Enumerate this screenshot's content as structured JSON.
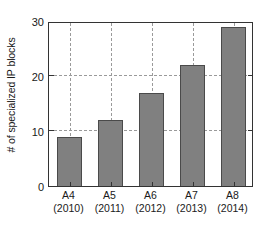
{
  "chart_data": {
    "type": "bar",
    "title": "",
    "xlabel": "",
    "ylabel": "# of specialized IP blocks",
    "categories": [
      "A4",
      "A5",
      "A6",
      "A7",
      "A8"
    ],
    "category_sublabels": [
      "(2010)",
      "(2011)",
      "(2012)",
      "(2013)",
      "(2014)"
    ],
    "values": [
      9,
      12,
      17,
      22,
      29
    ],
    "ylim": [
      0,
      30
    ],
    "yticks": [
      0,
      10,
      20,
      30
    ],
    "ytick_labels": [
      "0",
      "10",
      "20",
      "30"
    ],
    "grid": true,
    "grid_axis": "both",
    "legend": false,
    "legend_position": "none",
    "bar_color": "#808080",
    "bar_edge_color": "#4a4a4a",
    "grid_color": "#9a9a9a",
    "axis_color": "#333333",
    "background_color": "#ffffff"
  }
}
